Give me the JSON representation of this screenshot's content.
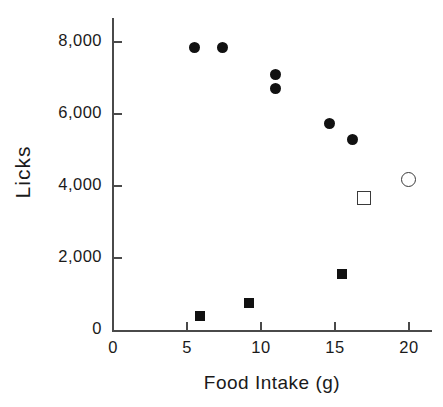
{
  "chart_data": {
    "type": "scatter",
    "title": "",
    "xlabel": "Food  Intake  (g)",
    "ylabel": "Licks",
    "xlim": [
      0,
      21.6
    ],
    "ylim": [
      0,
      8750
    ],
    "grid": false,
    "legend": "none",
    "xticks": [
      0,
      5,
      10,
      15,
      20
    ],
    "xtick_labels": [
      "0",
      "5",
      "10",
      "15",
      "20"
    ],
    "yticks": [
      0,
      2000,
      4000,
      6000,
      8000
    ],
    "ytick_labels": [
      "0",
      "2,000",
      "4,000",
      "6,000",
      "8,000"
    ],
    "series": [
      {
        "name": "filled-circle",
        "marker": "filled circle",
        "color": "#111111",
        "points": [
          {
            "x": 5.5,
            "y": 7850
          },
          {
            "x": 7.4,
            "y": 7850
          },
          {
            "x": 11.0,
            "y": 7100
          },
          {
            "x": 11.0,
            "y": 6700
          },
          {
            "x": 14.6,
            "y": 5750
          },
          {
            "x": 16.2,
            "y": 5300
          }
        ]
      },
      {
        "name": "filled-square",
        "marker": "filled square",
        "color": "#111111",
        "points": [
          {
            "x": 5.9,
            "y": 400
          },
          {
            "x": 9.2,
            "y": 750
          },
          {
            "x": 15.5,
            "y": 1550
          }
        ]
      },
      {
        "name": "open-square",
        "marker": "open square",
        "color": "#3a3a3a",
        "points": [
          {
            "x": 16.9,
            "y": 3700
          }
        ]
      },
      {
        "name": "open-circle",
        "marker": "open circle",
        "color": "#3a3a3a",
        "points": [
          {
            "x": 19.9,
            "y": 4200
          }
        ]
      }
    ]
  },
  "axis_color": "#4a4a4a",
  "text_color": "#1a1a1a"
}
